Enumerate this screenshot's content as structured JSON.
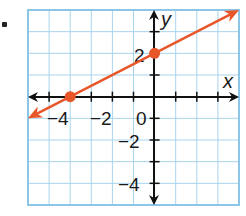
{
  "problem": {
    "bullet": "."
  },
  "chart_data": {
    "type": "line",
    "title": "",
    "xlabel": "x",
    "ylabel": "y",
    "xlim": [
      -6,
      4
    ],
    "ylim": [
      -5,
      4
    ],
    "grid": true,
    "x_tick_labels": [
      "-4",
      "-2",
      "0"
    ],
    "y_tick_labels": [
      "2",
      "-2",
      "-4"
    ],
    "series": [
      {
        "name": "line",
        "equation": "y = 0.5x + 2",
        "slope": 0.5,
        "intercept": 2,
        "color": "#e8572a",
        "points": [
          {
            "x": -4,
            "y": 0
          },
          {
            "x": 0,
            "y": 2
          }
        ]
      }
    ]
  },
  "labels": {
    "x_axis": "x",
    "y_axis": "y",
    "x_neg4": "−4",
    "x_neg2": "−2",
    "origin": "0",
    "y_pos2": "2",
    "y_neg2": "−2",
    "y_neg4": "−4"
  },
  "colors": {
    "grid": "#a8d4ee",
    "border": "#8cc6e6",
    "axis": "#111111",
    "line": "#e8572a"
  }
}
